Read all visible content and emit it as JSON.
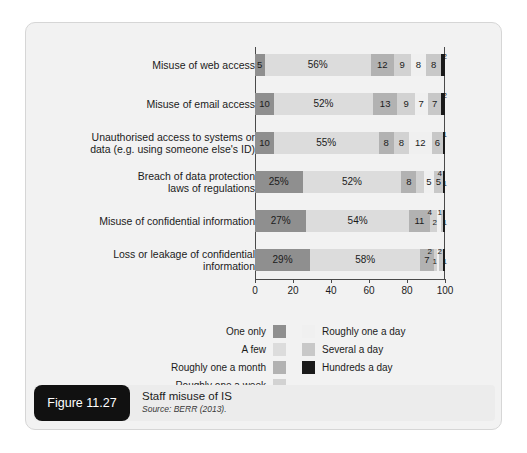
{
  "figure": {
    "badge": "Figure 11.27",
    "title": "Staff misuse of IS",
    "source": "Source: BERR (2013)."
  },
  "chart_data": {
    "type": "bar",
    "subtype": "stacked-horizontal-100",
    "title": "Staff misuse of IS",
    "xlabel": "",
    "ylabel": "",
    "xlim": [
      0,
      100
    ],
    "xticks": [
      0,
      20,
      40,
      60,
      80,
      100
    ],
    "grid": false,
    "legend_position": "bottom",
    "categories": [
      "Misuse of web access",
      "Misuse of email access",
      "Unauthorised access to systems or\ndata (e.g. using someone else's ID)",
      "Breach of data protection\nlaws of regulations",
      "Misuse of confidential information",
      "Loss or leakage of confidential\ninformation"
    ],
    "series": [
      {
        "name": "One only",
        "color": "#8f8f8f",
        "values": [
          5,
          10,
          10,
          25,
          27,
          29
        ]
      },
      {
        "name": "A few",
        "color": "#dcdcdc",
        "values": [
          56,
          52,
          55,
          52,
          54,
          58
        ]
      },
      {
        "name": "Roughly one a month",
        "color": "#b2b2b2",
        "values": [
          12,
          13,
          8,
          8,
          11,
          7
        ]
      },
      {
        "name": "Roughly one a week",
        "color": "#d2d2d2",
        "values": [
          9,
          9,
          8,
          4,
          4,
          2
        ]
      },
      {
        "name": "Roughly one a day",
        "color": "#f0f0f0",
        "values": [
          8,
          7,
          12,
          5,
          2,
          1
        ]
      },
      {
        "name": "Several a day",
        "color": "#c8c8c8",
        "values": [
          8,
          7,
          6,
          5,
          1,
          2
        ]
      },
      {
        "name": "Hundreds a day",
        "color": "#1a1a1a",
        "values": [
          2,
          2,
          1,
          1,
          1,
          1
        ]
      }
    ],
    "data_labels": [
      [
        "5",
        "56%",
        "12",
        "9",
        "8",
        "8",
        "2"
      ],
      [
        "10",
        "52%",
        "13",
        "9",
        "7",
        "7",
        "2"
      ],
      [
        "10",
        "55%",
        "8",
        "8",
        "12",
        "6",
        "1"
      ],
      [
        "25%",
        "52%",
        "8",
        "4",
        "5",
        "5",
        "1"
      ],
      [
        "27%",
        "54%",
        "11",
        "4",
        "2",
        "1",
        "1"
      ],
      [
        "29%",
        "58%",
        "7",
        "2",
        "1",
        "2",
        "1"
      ]
    ]
  },
  "legend": {
    "left_column": [
      {
        "label": "One only",
        "color": "#8f8f8f"
      },
      {
        "label": "A few",
        "color": "#dcdcdc"
      },
      {
        "label": "Roughly one a month",
        "color": "#b2b2b2"
      },
      {
        "label": "Roughly one a week",
        "color": "#d2d2d2"
      }
    ],
    "right_column": [
      {
        "label": "Roughly one a day",
        "color": "#f0f0f0"
      },
      {
        "label": "Several a day",
        "color": "#c8c8c8"
      },
      {
        "label": "Hundreds a day",
        "color": "#1a1a1a"
      }
    ]
  }
}
